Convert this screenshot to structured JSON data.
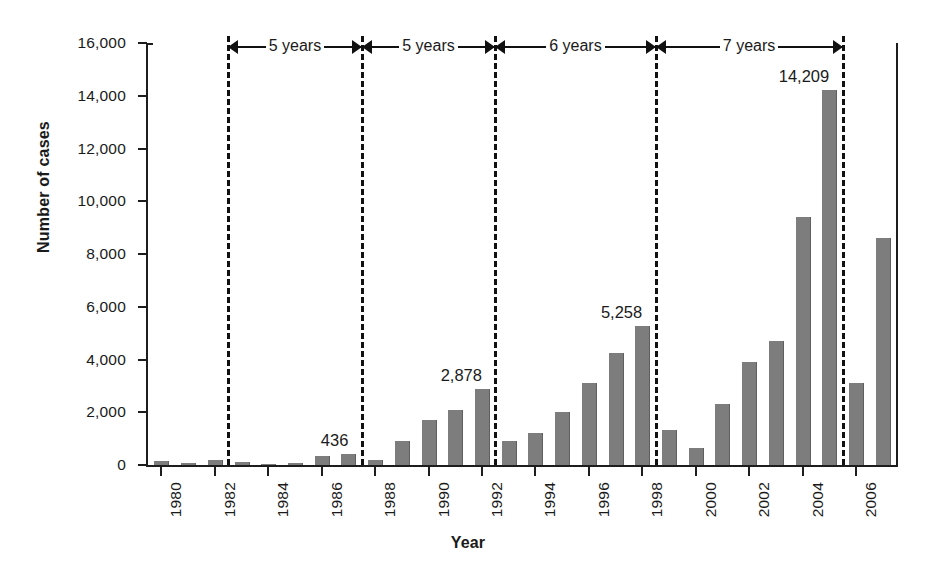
{
  "chart_data": {
    "type": "bar",
    "title": "",
    "xlabel": "Year",
    "ylabel": "Number of cases",
    "ylim": [
      0,
      16000
    ],
    "ytick_values": [
      0,
      2000,
      4000,
      6000,
      8000,
      10000,
      12000,
      14000,
      16000
    ],
    "ytick_labels": [
      "0",
      "2,000",
      "4,000",
      "6,000",
      "8,000",
      "10,000",
      "12,000",
      "14,000",
      "16,000"
    ],
    "xtick_labels": [
      "1980",
      "1982",
      "1984",
      "1986",
      "1988",
      "1990",
      "1992",
      "1994",
      "1996",
      "1998",
      "2000",
      "2002",
      "2004",
      "2006"
    ],
    "xtick_years": [
      1980,
      1982,
      1984,
      1986,
      1988,
      1990,
      1992,
      1994,
      1996,
      1998,
      2000,
      2002,
      2004,
      2006
    ],
    "grid": false,
    "legend": "none",
    "bar_color": "#7d7d7d",
    "categories": [
      1980,
      1981,
      1982,
      1983,
      1984,
      1985,
      1986,
      1987,
      1988,
      1989,
      1990,
      1991,
      1992,
      1993,
      1994,
      1995,
      1996,
      1997,
      1998,
      1999,
      2000,
      2001,
      2002,
      2003,
      2004,
      2005,
      2006,
      2007
    ],
    "values": [
      170,
      60,
      200,
      110,
      50,
      70,
      330,
      436,
      180,
      900,
      1700,
      2100,
      2878,
      900,
      1200,
      2000,
      3100,
      4250,
      5258,
      1330,
      640,
      2320,
      3900,
      4700,
      9400,
      14209,
      3120,
      8620
    ],
    "data_labels": [
      {
        "year": 1987,
        "text": "436",
        "value": 436
      },
      {
        "year": 1992,
        "text": "2,878",
        "value": 2878
      },
      {
        "year": 1998,
        "text": "5,258",
        "value": 5258
      },
      {
        "year": 2005,
        "text": "14,209",
        "value": 14209
      }
    ],
    "separators_at_year": [
      1982.5,
      1987.5,
      1992.5,
      1998.5,
      2005.5
    ],
    "period_brackets": [
      {
        "label": "5 years",
        "from_year": 1982.5,
        "to_year": 1987.5
      },
      {
        "label": "5 years",
        "from_year": 1987.5,
        "to_year": 1992.5
      },
      {
        "label": "6 years",
        "from_year": 1992.5,
        "to_year": 1998.5
      },
      {
        "label": "7 years",
        "from_year": 1998.5,
        "to_year": 2005.5
      }
    ]
  }
}
